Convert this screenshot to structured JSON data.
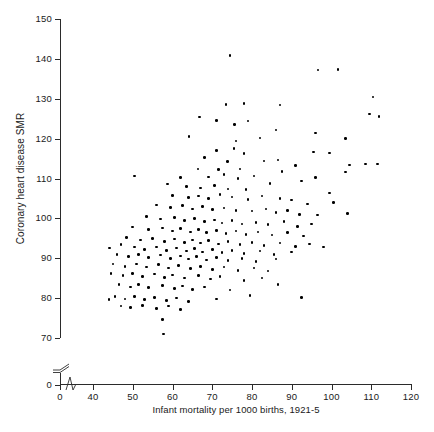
{
  "chart_data": {
    "type": "scatter",
    "title": "",
    "xlabel": "Infant mortality per 1000 births, 1921-5",
    "ylabel": "Coronary heart disease SMR",
    "xlim": [
      35,
      120
    ],
    "ylim": [
      65,
      150
    ],
    "x_axis_break": true,
    "y_axis_break": true,
    "grid": false,
    "legend": null,
    "marker": "filled-circle",
    "marker_color": "#000000",
    "xticks": [
      0,
      40,
      50,
      60,
      70,
      80,
      90,
      100,
      110,
      120
    ],
    "xtick_labels": [
      "0",
      "40",
      "50",
      "60",
      "70",
      "80",
      "90",
      "100",
      "110",
      "120"
    ],
    "yticks": [
      0,
      70,
      80,
      90,
      100,
      110,
      120,
      130,
      140,
      150
    ],
    "ytick_labels": [
      "0",
      "70",
      "80",
      "90",
      "100",
      "110",
      "120",
      "130",
      "140",
      "150"
    ],
    "n_points": 212,
    "points": [
      [
        74.5,
        140.8
      ],
      [
        96.6,
        137.2
      ],
      [
        101.6,
        137.4
      ],
      [
        110.4,
        130.4
      ],
      [
        73.5,
        128.5
      ],
      [
        78.0,
        128.8
      ],
      [
        87.0,
        128.4
      ],
      [
        109.5,
        126.2
      ],
      [
        112.0,
        125.6
      ],
      [
        66.8,
        125.4
      ],
      [
        71.0,
        124.6
      ],
      [
        75.6,
        123.6
      ],
      [
        79.0,
        124.4
      ],
      [
        86.0,
        122.2
      ],
      [
        96.0,
        121.4
      ],
      [
        64.2,
        120.6
      ],
      [
        76.0,
        119.4
      ],
      [
        82.0,
        120.2
      ],
      [
        103.5,
        120.0
      ],
      [
        50.5,
        110.6
      ],
      [
        71.0,
        117.0
      ],
      [
        75.5,
        117.5
      ],
      [
        78.0,
        116.2
      ],
      [
        95.5,
        116.6
      ],
      [
        99.5,
        116.4
      ],
      [
        68.0,
        115.2
      ],
      [
        73.8,
        114.2
      ],
      [
        83.0,
        114.4
      ],
      [
        86.5,
        114.6
      ],
      [
        91.0,
        113.2
      ],
      [
        104.5,
        113.4
      ],
      [
        108.5,
        113.6
      ],
      [
        111.5,
        113.6
      ],
      [
        66.4,
        112.4
      ],
      [
        71.5,
        112.2
      ],
      [
        77.0,
        112.4
      ],
      [
        87.5,
        111.8
      ],
      [
        103.5,
        111.6
      ],
      [
        62.0,
        110.2
      ],
      [
        69.0,
        110.4
      ],
      [
        73.0,
        111.0
      ],
      [
        76.5,
        110.0
      ],
      [
        80.5,
        110.6
      ],
      [
        92.5,
        109.4
      ],
      [
        96.0,
        110.2
      ],
      [
        58.8,
        108.6
      ],
      [
        63.5,
        108.0
      ],
      [
        67.0,
        107.6
      ],
      [
        70.5,
        108.2
      ],
      [
        74.0,
        107.4
      ],
      [
        78.5,
        107.2
      ],
      [
        84.5,
        108.8
      ],
      [
        99.5,
        106.4
      ],
      [
        60.0,
        105.8
      ],
      [
        64.0,
        105.2
      ],
      [
        66.5,
        105.6
      ],
      [
        69.0,
        105.0
      ],
      [
        72.0,
        106.0
      ],
      [
        75.0,
        105.4
      ],
      [
        79.0,
        104.8
      ],
      [
        82.5,
        105.6
      ],
      [
        87.0,
        105.0
      ],
      [
        90.0,
        104.6
      ],
      [
        94.0,
        103.6
      ],
      [
        100.5,
        104.0
      ],
      [
        56.0,
        103.4
      ],
      [
        59.5,
        102.8
      ],
      [
        62.5,
        103.2
      ],
      [
        65.0,
        102.4
      ],
      [
        67.5,
        103.0
      ],
      [
        70.0,
        102.2
      ],
      [
        73.0,
        102.6
      ],
      [
        76.0,
        102.0
      ],
      [
        80.0,
        101.8
      ],
      [
        83.5,
        102.4
      ],
      [
        86.0,
        101.4
      ],
      [
        89.0,
        102.0
      ],
      [
        92.0,
        101.0
      ],
      [
        96.5,
        100.8
      ],
      [
        104.0,
        101.2
      ],
      [
        53.5,
        100.4
      ],
      [
        57.0,
        99.8
      ],
      [
        60.5,
        100.2
      ],
      [
        63.0,
        99.4
      ],
      [
        65.5,
        100.0
      ],
      [
        68.0,
        99.2
      ],
      [
        70.5,
        99.6
      ],
      [
        72.5,
        98.8
      ],
      [
        75.0,
        99.4
      ],
      [
        77.5,
        98.6
      ],
      [
        81.0,
        99.0
      ],
      [
        84.0,
        98.4
      ],
      [
        88.0,
        99.2
      ],
      [
        91.5,
        98.0
      ],
      [
        95.0,
        98.6
      ],
      [
        50.0,
        97.8
      ],
      [
        54.0,
        97.2
      ],
      [
        57.5,
        97.6
      ],
      [
        60.0,
        96.8
      ],
      [
        62.0,
        97.4
      ],
      [
        64.5,
        96.6
      ],
      [
        66.5,
        97.2
      ],
      [
        68.5,
        96.4
      ],
      [
        71.0,
        97.0
      ],
      [
        73.5,
        96.2
      ],
      [
        76.0,
        96.8
      ],
      [
        78.5,
        96.0
      ],
      [
        81.5,
        96.6
      ],
      [
        85.0,
        95.8
      ],
      [
        89.0,
        96.4
      ],
      [
        93.0,
        95.6
      ],
      [
        44.2,
        92.6
      ],
      [
        48.5,
        95.2
      ],
      [
        52.0,
        94.6
      ],
      [
        55.0,
        95.0
      ],
      [
        58.0,
        94.2
      ],
      [
        60.5,
        94.8
      ],
      [
        63.0,
        94.0
      ],
      [
        65.0,
        94.6
      ],
      [
        67.0,
        93.8
      ],
      [
        69.0,
        94.4
      ],
      [
        71.5,
        93.6
      ],
      [
        74.0,
        94.2
      ],
      [
        77.0,
        93.4
      ],
      [
        80.0,
        94.0
      ],
      [
        83.0,
        93.2
      ],
      [
        87.0,
        93.8
      ],
      [
        91.0,
        93.0
      ],
      [
        94.5,
        93.6
      ],
      [
        98.0,
        92.8
      ],
      [
        47.0,
        93.4
      ],
      [
        50.5,
        92.8
      ],
      [
        53.0,
        92.2
      ],
      [
        56.0,
        92.8
      ],
      [
        58.5,
        92.0
      ],
      [
        61.0,
        92.6
      ],
      [
        63.5,
        91.8
      ],
      [
        65.5,
        92.4
      ],
      [
        67.5,
        91.6
      ],
      [
        70.0,
        92.2
      ],
      [
        72.5,
        91.4
      ],
      [
        75.0,
        92.0
      ],
      [
        78.0,
        91.2
      ],
      [
        82.0,
        91.8
      ],
      [
        85.5,
        91.0
      ],
      [
        90.0,
        91.6
      ],
      [
        46.0,
        91.0
      ],
      [
        49.0,
        90.4
      ],
      [
        51.5,
        91.0
      ],
      [
        54.0,
        90.2
      ],
      [
        57.0,
        90.8
      ],
      [
        59.5,
        90.0
      ],
      [
        62.0,
        90.6
      ],
      [
        64.0,
        89.8
      ],
      [
        66.0,
        90.4
      ],
      [
        68.5,
        89.6
      ],
      [
        71.0,
        90.2
      ],
      [
        74.0,
        89.4
      ],
      [
        77.5,
        90.0
      ],
      [
        81.0,
        89.2
      ],
      [
        86.0,
        89.8
      ],
      [
        45.0,
        88.6
      ],
      [
        48.0,
        88.0
      ],
      [
        51.0,
        88.6
      ],
      [
        53.5,
        87.8
      ],
      [
        56.5,
        88.4
      ],
      [
        59.0,
        87.6
      ],
      [
        61.5,
        88.2
      ],
      [
        64.5,
        87.4
      ],
      [
        67.0,
        88.0
      ],
      [
        70.0,
        87.2
      ],
      [
        73.0,
        87.8
      ],
      [
        76.5,
        87.0
      ],
      [
        80.5,
        87.6
      ],
      [
        84.0,
        86.8
      ],
      [
        44.5,
        86.2
      ],
      [
        47.5,
        85.6
      ],
      [
        50.0,
        86.2
      ],
      [
        52.5,
        85.4
      ],
      [
        55.5,
        86.0
      ],
      [
        58.0,
        85.2
      ],
      [
        60.0,
        85.8
      ],
      [
        63.0,
        85.0
      ],
      [
        66.5,
        85.6
      ],
      [
        69.5,
        84.8
      ],
      [
        72.0,
        85.4
      ],
      [
        78.0,
        84.4
      ],
      [
        82.5,
        85.0
      ],
      [
        46.5,
        83.4
      ],
      [
        49.5,
        82.8
      ],
      [
        51.5,
        83.4
      ],
      [
        54.0,
        82.6
      ],
      [
        57.5,
        83.2
      ],
      [
        60.5,
        82.4
      ],
      [
        62.5,
        83.0
      ],
      [
        65.0,
        82.2
      ],
      [
        68.0,
        82.8
      ],
      [
        74.5,
        82.0
      ],
      [
        86.5,
        83.4
      ],
      [
        45.5,
        80.4
      ],
      [
        48.0,
        79.8
      ],
      [
        50.5,
        80.4
      ],
      [
        53.0,
        79.6
      ],
      [
        55.5,
        80.2
      ],
      [
        58.5,
        79.4
      ],
      [
        61.0,
        80.0
      ],
      [
        64.0,
        79.2
      ],
      [
        71.0,
        79.8
      ],
      [
        79.5,
        80.6
      ],
      [
        92.5,
        80.2
      ],
      [
        44.0,
        79.6
      ],
      [
        47.0,
        78.0
      ],
      [
        49.5,
        77.6
      ],
      [
        52.5,
        78.2
      ],
      [
        56.0,
        77.4
      ],
      [
        59.0,
        78.0
      ],
      [
        62.0,
        77.2
      ],
      [
        57.5,
        74.6
      ],
      [
        57.8,
        71.0
      ]
    ]
  },
  "axes": {
    "y_title": "Coronary heart disease SMR",
    "x_title": "Infant mortality per 1000 births, 1921-5"
  }
}
